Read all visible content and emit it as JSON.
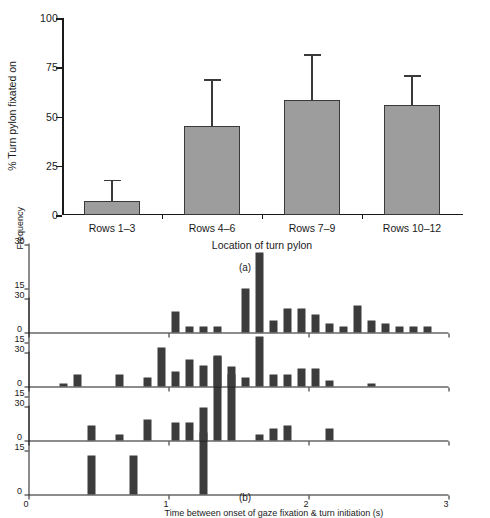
{
  "figure": {
    "panel_a_caption": "(a)",
    "panel_b_caption": "(b)"
  },
  "chart_data": [
    {
      "type": "bar",
      "panel": "(a)",
      "title": "",
      "xlabel": "Location of turn pylon",
      "ylabel": "% Turn pylon fixated on",
      "categories": [
        "Rows 1–3",
        "Rows 4–6",
        "Rows 7–9",
        "Rows 10–12"
      ],
      "values": [
        7,
        45,
        58.5,
        56
      ],
      "errors_upper": [
        11,
        24,
        23,
        15
      ],
      "ylim": [
        0,
        100
      ],
      "yticks": [
        0,
        25,
        50,
        75,
        100
      ],
      "ytick_labels": [
        "0",
        "25",
        "50",
        "75",
        "100"
      ],
      "grid": false,
      "legend": "none",
      "bar_color": "#9d9d9d",
      "bar_edge_color": "#3a3a3a",
      "error_bar_color": "#3a3a3a"
    },
    {
      "type": "bar",
      "panel": "(b)",
      "orientation": "horizontal",
      "title": "",
      "xlabel": "Frequency",
      "ylabel": "Time between onset of gaze fixation & turn initiation (s)",
      "xlim": [
        0,
        30
      ],
      "xticks": [
        0,
        15,
        30
      ],
      "xtick_labels": [
        "0",
        "15",
        "30"
      ],
      "ylim": [
        0,
        3
      ],
      "yticks": [
        0,
        1,
        2,
        3
      ],
      "ytick_labels": [
        "0",
        "1",
        "2",
        "3"
      ],
      "grid": false,
      "legend": "none",
      "bar_color": "#3c3c3c",
      "bin_width": 0.1,
      "series": [
        {
          "name": "Rows 1–3",
          "bin_starts": [
            0.4,
            0.7,
            1.2
          ],
          "values": [
            13,
            13,
            21
          ]
        },
        {
          "name": "Rows 4–6",
          "bin_starts": [
            0.4,
            0.6,
            0.8,
            1.0,
            1.1,
            1.2,
            1.3,
            1.4,
            1.6,
            1.7,
            1.8,
            2.1
          ],
          "values": [
            5,
            2,
            7,
            6,
            6,
            11,
            29,
            25,
            2,
            4,
            5,
            4,
            2
          ]
        },
        {
          "name": "Rows 7–9",
          "bin_starts": [
            0.2,
            0.3,
            0.6,
            0.8,
            0.9,
            1.0,
            1.1,
            1.2,
            1.3,
            1.4,
            1.5,
            1.6,
            1.7,
            1.8,
            1.9,
            2.0,
            2.1,
            2.4
          ],
          "values": [
            1,
            4,
            4,
            3,
            13,
            5,
            9,
            7,
            10,
            4,
            3,
            17,
            4,
            4,
            6,
            6,
            2,
            1
          ]
        },
        {
          "name": "Rows 10–12",
          "bin_starts": [
            1.0,
            1.1,
            1.2,
            1.3,
            1.5,
            1.6,
            1.7,
            1.8,
            1.9,
            2.0,
            2.1,
            2.2,
            2.3,
            2.4,
            2.5,
            2.6,
            2.7,
            2.8
          ],
          "values": [
            7,
            2,
            2,
            2,
            15,
            27,
            4,
            8,
            8,
            6,
            3,
            2,
            9,
            4,
            3,
            2,
            2,
            2
          ]
        }
      ]
    }
  ]
}
